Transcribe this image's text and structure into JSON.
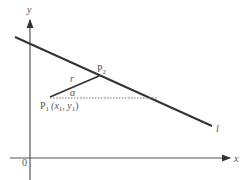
{
  "diagram": {
    "axes": {
      "x_label": "x",
      "y_label": "y",
      "origin_label": "0"
    },
    "line_label": "l",
    "points": {
      "p1": {
        "name": "P",
        "sub": "1",
        "coords": "(x",
        "coords_sub1": "1",
        "coords_mid": ", y",
        "coords_sub2": "1",
        "coords_end": ")"
      },
      "p2": {
        "name": "P",
        "sub": "2"
      }
    },
    "segment_label": "r",
    "angle_label": "α"
  }
}
